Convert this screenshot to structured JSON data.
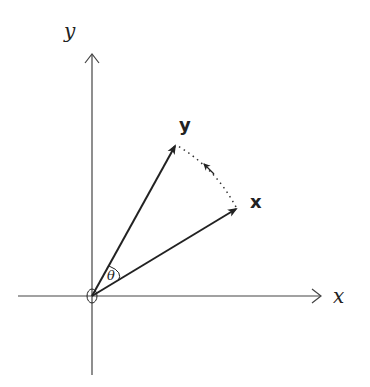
{
  "diagram": {
    "axes": {
      "x_label": "x",
      "y_label": "y"
    },
    "vectors": [
      {
        "name": "x",
        "label": "x"
      },
      {
        "name": "y",
        "label": "y"
      }
    ],
    "angle_label": "θ",
    "colors": {
      "stroke": "#222222",
      "axis": "#444444",
      "background": "#ffffff"
    }
  }
}
